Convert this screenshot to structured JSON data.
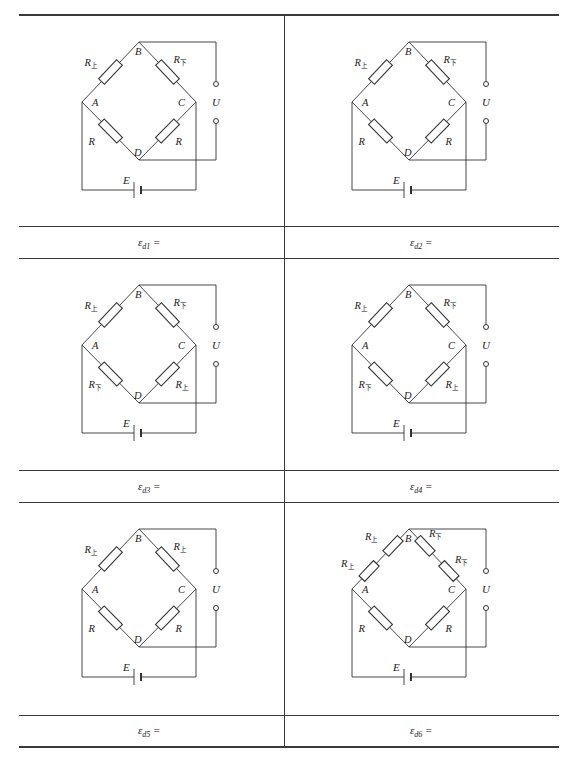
{
  "table": {
    "rows": 3,
    "columns": 2,
    "line_color": "#3a3a3a"
  },
  "node_labels": {
    "top": "B",
    "left": "A",
    "right": "C",
    "bottom": "D"
  },
  "output_label": "U",
  "source_label": "E",
  "subscripts": {
    "upper": "上",
    "lower": "下"
  },
  "cells": [
    {
      "id": 1,
      "formula": {
        "symbol": "ε",
        "sub": "d1",
        "suffix": " ="
      },
      "arms": {
        "AB": [
          {
            "base": "R",
            "sub": "上"
          }
        ],
        "BC": [
          {
            "base": "R",
            "sub": "下"
          }
        ],
        "AD": [
          {
            "base": "R",
            "sub": ""
          }
        ],
        "DC": [
          {
            "base": "R",
            "sub": ""
          }
        ]
      }
    },
    {
      "id": 2,
      "formula": {
        "symbol": "ε",
        "sub": "d2",
        "suffix": " ="
      },
      "arms": {
        "AB": [
          {
            "base": "R",
            "sub": "上"
          }
        ],
        "BC": [
          {
            "base": "R",
            "sub": "下"
          }
        ],
        "AD": [
          {
            "base": "R",
            "sub": ""
          }
        ],
        "DC": [
          {
            "base": "R",
            "sub": ""
          }
        ]
      }
    },
    {
      "id": 3,
      "formula": {
        "symbol": "ε",
        "sub": "d3",
        "suffix": " ="
      },
      "arms": {
        "AB": [
          {
            "base": "R",
            "sub": "上"
          }
        ],
        "BC": [
          {
            "base": "R",
            "sub": "下"
          }
        ],
        "AD": [
          {
            "base": "R",
            "sub": "下"
          }
        ],
        "DC": [
          {
            "base": "R",
            "sub": "上"
          }
        ]
      }
    },
    {
      "id": 4,
      "formula": {
        "symbol": "ε",
        "sub": "d4",
        "suffix": " ="
      },
      "arms": {
        "AB": [
          {
            "base": "R",
            "sub": "上"
          }
        ],
        "BC": [
          {
            "base": "R",
            "sub": "下"
          }
        ],
        "AD": [
          {
            "base": "R",
            "sub": "下"
          }
        ],
        "DC": [
          {
            "base": "R",
            "sub": "上"
          }
        ]
      }
    },
    {
      "id": 5,
      "formula": {
        "symbol": "ε",
        "sub": "d5",
        "suffix": " ="
      },
      "arms": {
        "AB": [
          {
            "base": "R",
            "sub": "上"
          }
        ],
        "BC": [
          {
            "base": "R",
            "sub": "上"
          }
        ],
        "AD": [
          {
            "base": "R",
            "sub": ""
          }
        ],
        "DC": [
          {
            "base": "R",
            "sub": ""
          }
        ]
      }
    },
    {
      "id": 6,
      "formula": {
        "symbol": "ε",
        "sub": "d6",
        "suffix": " ="
      },
      "arms": {
        "AB": [
          {
            "base": "R",
            "sub": "上"
          },
          {
            "base": "R",
            "sub": "上"
          }
        ],
        "BC": [
          {
            "base": "R",
            "sub": "下"
          },
          {
            "base": "R",
            "sub": "下"
          }
        ],
        "AD": [
          {
            "base": "R",
            "sub": ""
          }
        ],
        "DC": [
          {
            "base": "R",
            "sub": ""
          }
        ]
      }
    }
  ]
}
